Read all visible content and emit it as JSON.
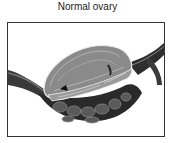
{
  "figure": {
    "title": "Normal ovary",
    "illustration": {
      "subject": "ovary-illustration",
      "style": "grayscale medical drawing"
    }
  }
}
